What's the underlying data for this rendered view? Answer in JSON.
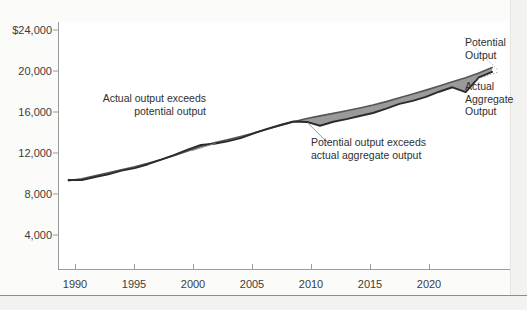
{
  "chart_data": {
    "type": "line",
    "title": "",
    "xlabel": "",
    "ylabel": "",
    "xlim": [
      1989.2,
      2023.2
    ],
    "ylim": [
      0,
      26000
    ],
    "yticks": [
      4000,
      8000,
      12000,
      16000,
      20000,
      24000
    ],
    "ytick_labels": [
      "4,000",
      "8,000",
      "12,000",
      "16,000",
      "20,000",
      "$24,000"
    ],
    "xticks": [
      1990,
      1995,
      2000,
      2005,
      2010,
      2015,
      2020
    ],
    "xtick_labels": [
      "1990",
      "1995",
      "2000",
      "2005",
      "2010",
      "2015",
      "2020"
    ],
    "grid": false,
    "legend": "none",
    "x": [
      1990,
      1991,
      1992,
      1993,
      1994,
      1995,
      1996,
      1997,
      1998,
      1999,
      2000,
      2001,
      2002,
      2003,
      2004,
      2005,
      2006,
      2007,
      2008,
      2009,
      2010,
      2011,
      2012,
      2013,
      2014,
      2015,
      2016,
      2017,
      2018,
      2019,
      2020,
      2021,
      2022
    ],
    "series": [
      {
        "name": "Potential Output",
        "color": "#555555",
        "values": [
          9300,
          9500,
          9820,
          10120,
          10450,
          10760,
          11120,
          11520,
          11960,
          12420,
          12900,
          13290,
          13610,
          13950,
          14320,
          14720,
          15120,
          15500,
          15850,
          16120,
          16380,
          16650,
          16940,
          17260,
          17620,
          18020,
          18420,
          18830,
          19260,
          19700,
          20130,
          20620,
          21200
        ]
      },
      {
        "name": "Actual Aggregate Output",
        "color": "#2b2b2b",
        "values": [
          9370,
          9360,
          9680,
          9960,
          10360,
          10620,
          11030,
          11510,
          12010,
          12560,
          13060,
          13180,
          13430,
          13780,
          14280,
          14750,
          15160,
          15530,
          15480,
          15080,
          15500,
          15780,
          16100,
          16420,
          16880,
          17380,
          17700,
          18120,
          18660,
          19130,
          18620,
          20180,
          20750
        ]
      }
    ],
    "annotations": [
      {
        "name": "actual-exceeds-potential",
        "text": "Actual output exceeds\npotential output",
        "pointer_from": [
          1999.3,
          12450
        ],
        "pointer_to": [
          2001.1,
          13230
        ]
      },
      {
        "name": "potential-exceeds-actual",
        "text": "Potential output exceeds\nactual aggregate output",
        "pointer_from": [
          2009.6,
          13250
        ],
        "pointer_to": [
          2008.1,
          15330
        ]
      },
      {
        "name": "potential-output-label",
        "text": "Potential\nOutput",
        "pointer_to": [
          2022.4,
          21000
        ]
      },
      {
        "name": "actual-aggregate-output-label",
        "text": "Actual\nAggregate\nOutput",
        "pointer_to": [
          2022.4,
          20700
        ]
      }
    ],
    "shading": {
      "name": "output-gap-fill",
      "color": "#9a9a9a",
      "description": "Area between potential output and actual aggregate output curves"
    }
  },
  "labels": {
    "y": [
      "$24,000",
      "20,000",
      "16,000",
      "12,000",
      "8,000",
      "4,000"
    ],
    "x": [
      "1990",
      "1995",
      "2000",
      "2005",
      "2010",
      "2015",
      "2020"
    ],
    "annot_left_line1": "Actual output exceeds",
    "annot_left_line2": "potential output",
    "annot_mid_line1": "Potential output exceeds",
    "annot_mid_line2": "actual aggregate output",
    "annot_potential_line1": "Potential",
    "annot_potential_line2": "Output",
    "annot_actual_line1": "Actual",
    "annot_actual_line2": "Aggregate",
    "annot_actual_line3": "Output"
  },
  "colors": {
    "background": "#f2f2f0",
    "panel": "#fbfbfa",
    "plot_bg": "#ffffff",
    "axis": "#9b9b9b",
    "potential_line": "#555555",
    "actual_line": "#2b2b2b",
    "gap_fill": "#9a9a9a",
    "text": "#2f2f2f"
  }
}
